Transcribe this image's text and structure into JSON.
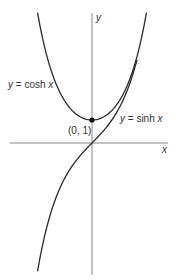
{
  "chart_data": {
    "type": "line",
    "title": "",
    "xlabel": "x",
    "ylabel": "y",
    "grid": false,
    "series": [
      {
        "name": "y = cosh x",
        "function": "cosh",
        "x_range": [
          -2.42,
          2.42
        ]
      },
      {
        "name": "y = sinh x",
        "function": "sinh",
        "x_range": [
          -2.42,
          2.0
        ]
      }
    ],
    "annotations": [
      {
        "text": "(0, 1)",
        "point": [
          0,
          1
        ]
      }
    ]
  },
  "labels": {
    "y_axis": "y",
    "x_axis": "x",
    "cosh_prefix": "y",
    "cosh_eq": " = cosh ",
    "cosh_var": "x",
    "sinh_prefix": "y",
    "sinh_eq": " = sinh ",
    "sinh_var": "x",
    "point": "(0, 1)"
  },
  "colors": {
    "curve": "#2a2a2a",
    "axis": "#8a8a8a",
    "text": "#333333"
  }
}
